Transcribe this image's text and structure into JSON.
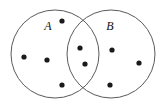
{
  "figure": {
    "name": "venn-diagram-two-sets",
    "background_color": "#ffffff",
    "width": 165,
    "height": 106
  },
  "style": {
    "outline_color": "#5a5a5a",
    "outline_width": 1,
    "dot_color": "#1a1a1a",
    "dot_radius": 2.6,
    "label_color": "#111111",
    "label_font_size": 12
  },
  "chart_data": {
    "type": "scatter",
    "title": "",
    "xlabel": "",
    "ylabel": "",
    "sets": [
      {
        "label": "A",
        "label_x": 48,
        "label_y": 27,
        "center_x": 55,
        "center_y": 54,
        "radius": 44
      },
      {
        "label": "B",
        "label_x": 110,
        "label_y": 27,
        "center_x": 111,
        "center_y": 54,
        "radius": 44
      }
    ],
    "regions": [
      {
        "name": "A only",
        "count": 4
      },
      {
        "name": "A and B",
        "count": 2
      },
      {
        "name": "B only",
        "count": 3
      }
    ],
    "points": [
      {
        "x": 62,
        "y": 21,
        "region": "A only"
      },
      {
        "x": 24,
        "y": 57,
        "region": "A only"
      },
      {
        "x": 47,
        "y": 60,
        "region": "A only"
      },
      {
        "x": 62,
        "y": 85,
        "region": "A only"
      },
      {
        "x": 80,
        "y": 48,
        "region": "A and B"
      },
      {
        "x": 85,
        "y": 64,
        "region": "A and B"
      },
      {
        "x": 112,
        "y": 50,
        "region": "B only"
      },
      {
        "x": 139,
        "y": 63,
        "region": "B only"
      },
      {
        "x": 110,
        "y": 85,
        "region": "B only"
      }
    ]
  }
}
